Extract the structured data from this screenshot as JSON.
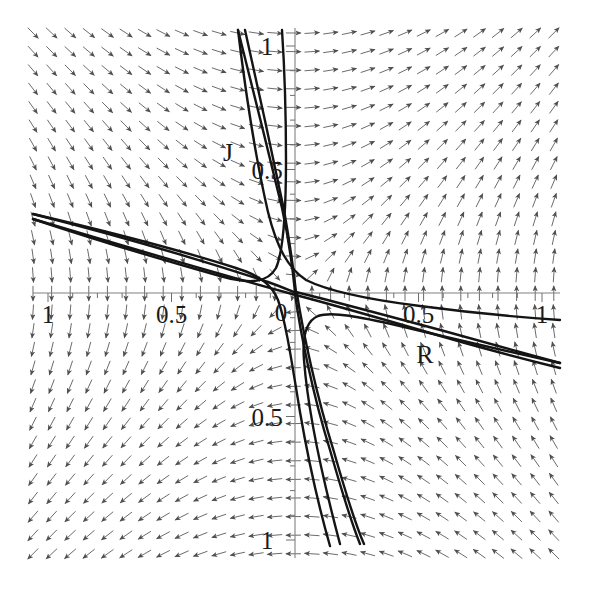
{
  "figure": {
    "kind": "phase-portrait",
    "width": 591,
    "height": 589,
    "background": "#ffffff",
    "arrow_color": "#555555",
    "trajectory_color": "#111111",
    "axis_color": "#777777"
  },
  "axes": {
    "horizontal": {
      "name": "R",
      "name_x": 425,
      "name_y": 363,
      "origin_px": 295,
      "unit_px": 247,
      "ticks": [
        {
          "value": -1,
          "label": "1"
        },
        {
          "value": -0.5,
          "label": "0.5"
        },
        {
          "value": 0,
          "label": "0"
        },
        {
          "value": 0.5,
          "label": "0.5"
        },
        {
          "value": 1,
          "label": "1"
        }
      ],
      "minor_tick_step": 0.1,
      "range": [
        -1.06,
        1.06
      ]
    },
    "vertical": {
      "name": "J",
      "name_x": 228,
      "name_y": 161,
      "origin_px": 293,
      "unit_px": 247,
      "ticks": [
        {
          "value": 1,
          "label": "1"
        },
        {
          "value": 0.5,
          "label": "0.5"
        },
        {
          "value": -0.5,
          "label": "0.5"
        },
        {
          "value": -1,
          "label": "1"
        }
      ],
      "minor_tick_step": 0.1,
      "range": [
        -1.06,
        1.06
      ]
    }
  },
  "chart_data": {
    "type": "scatter",
    "title": "",
    "xlabel": "R",
    "ylabel": "J",
    "xlim": [
      -1.06,
      1.06
    ],
    "ylim": [
      -1.06,
      1.06
    ],
    "grid": false,
    "legend": "none",
    "annotations": [
      {
        "text": "J",
        "x": -0.27,
        "y": 0.53
      },
      {
        "text": "R",
        "x": 0.53,
        "y": -0.28
      }
    ],
    "tick_labels": {
      "x": [
        "1",
        "0.5",
        "0",
        "0.5",
        "1"
      ],
      "y": [
        "1",
        "0.5",
        "0.5",
        "1"
      ]
    },
    "vector_field": {
      "description": "Normalized direction field of a linear saddle system dR/dt = J, dJ/dt = R",
      "dR_dt": "J",
      "dJ_dt": "R",
      "grid_columns": 29,
      "grid_rows": 29,
      "grid_spacing_px": 18.6,
      "grid_origin_px": [
        33,
        33
      ],
      "arrow_length_px": 15,
      "normalized": true
    },
    "trajectories": [
      {
        "name": "separatrix-stable-upper",
        "branch": "J = -R, upper-left to lower-right",
        "slope": -1
      },
      {
        "name": "separatrix-stable-lower",
        "branch": "J = -R offset companion",
        "slope": -1
      },
      {
        "name": "separatrix-unstable-left",
        "branch": "J = +R, upper-center descending",
        "slope": 1
      },
      {
        "name": "separatrix-unstable-right",
        "branch": "J = +R companion, lower-right",
        "slope": 1
      },
      {
        "name": "hyperbola-quadrant-I",
        "branch": "R*J = const, upper-right of saddle"
      },
      {
        "name": "hyperbola-quadrant-III",
        "branch": "R*J = const, lower-left of saddle"
      }
    ],
    "fixed_points": [
      {
        "type": "saddle",
        "x": 0,
        "y": 0
      }
    ]
  }
}
